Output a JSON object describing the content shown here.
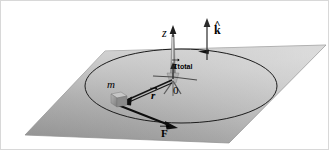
{
  "figure": {
    "name": "torque-diagram",
    "background_color": "#ffffff",
    "border_color": "#d8d8d8"
  },
  "labels": {
    "z_axis": "z",
    "k_unit_vector": "k",
    "k_hat_mark": "^",
    "torque_symbol": "τ",
    "torque_subscript": "total",
    "origin": "0",
    "mass": "m",
    "position_vector": "r",
    "force_vector": "F"
  },
  "plane": {
    "name": "horizontal-plane",
    "fill_light": "#e8e8e8",
    "fill_mid": "#b9b9b9",
    "fill_dark": "#8f8f8f",
    "edge_color": "#8a8a8a",
    "corners": [
      [
        104,
        50
      ],
      [
        325,
        44
      ],
      [
        228,
        142
      ],
      [
        24,
        134
      ]
    ]
  },
  "orbit": {
    "name": "circular-orbit-ellipse",
    "center": [
      180,
      85
    ],
    "radius_x": 96,
    "radius_y": 37,
    "stroke": "#1a1a1a",
    "direction": "counterclockwise",
    "arrow_position": [
      203,
      49
    ]
  },
  "vectors": [
    {
      "name": "z-axis-arrow",
      "from": [
        172,
        72
      ],
      "to": [
        172,
        28
      ],
      "color": "#262626",
      "style": "cone-shaft"
    },
    {
      "name": "k-unit-vector",
      "from": [
        206,
        58
      ],
      "to": [
        206,
        18
      ],
      "color": "#2b2b2b",
      "style": "thin-arrow"
    },
    {
      "name": "torque-vector",
      "from": [
        172,
        78
      ],
      "to": [
        172,
        62
      ],
      "color": "#2b2b2b",
      "style": "short-arrow"
    },
    {
      "name": "position-vector-r",
      "from": [
        172,
        78
      ],
      "to": [
        120,
        101
      ],
      "color": "#1a1a1a",
      "style": "thick-arrow"
    },
    {
      "name": "force-vector-F",
      "from": [
        118,
        103
      ],
      "to": [
        175,
        126
      ],
      "color": "#111111",
      "style": "thick-arrow"
    }
  ],
  "mass_block": {
    "name": "point-mass-cube",
    "position": [
      113,
      93
    ],
    "size": [
      13,
      12
    ],
    "face_color": "#9a9a9a",
    "top_color": "#c2c2c2",
    "side_color": "#7a7a7a"
  }
}
